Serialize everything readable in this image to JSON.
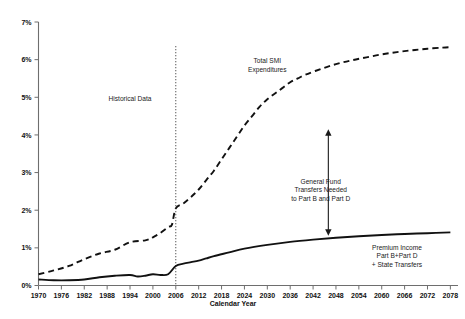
{
  "chart_data": {
    "type": "line",
    "title": "",
    "xlabel": "Calendar Year",
    "ylabel": "",
    "xlim": [
      1970,
      2080
    ],
    "ylim": [
      0,
      7
    ],
    "grid": false,
    "legend_position": "inline-annotations",
    "ytick_labels": [
      "0%",
      "1%",
      "2%",
      "3%",
      "4%",
      "5%",
      "6%",
      "7%"
    ],
    "ytick_values": [
      0,
      1,
      2,
      3,
      4,
      5,
      6,
      7
    ],
    "xtick_labels": [
      "1970",
      "1976",
      "1982",
      "1988",
      "1994",
      "2000",
      "2006",
      "2012",
      "2018",
      "2024",
      "2030",
      "2036",
      "2042",
      "2048",
      "2054",
      "2060",
      "2066",
      "2072",
      "2078"
    ],
    "xtick_values": [
      1970,
      1976,
      1982,
      1988,
      1994,
      2000,
      2006,
      2012,
      2018,
      2024,
      2030,
      2036,
      2042,
      2048,
      2054,
      2060,
      2066,
      2072,
      2078
    ],
    "series": [
      {
        "name": "Total SMI Expenditures",
        "style": "dashed",
        "x": [
          1970,
          1974,
          1978,
          1982,
          1986,
          1990,
          1994,
          1998,
          2000,
          2002,
          2004,
          2005,
          2006,
          2008,
          2010,
          2012,
          2014,
          2016,
          2018,
          2020,
          2022,
          2024,
          2026,
          2028,
          2030,
          2032,
          2034,
          2036,
          2038,
          2040,
          2044,
          2048,
          2052,
          2056,
          2060,
          2064,
          2068,
          2072,
          2076,
          2078
        ],
        "values": [
          0.3,
          0.4,
          0.52,
          0.7,
          0.85,
          0.95,
          1.15,
          1.2,
          1.28,
          1.4,
          1.55,
          1.62,
          2.05,
          2.18,
          2.35,
          2.55,
          2.8,
          3.05,
          3.35,
          3.65,
          3.95,
          4.25,
          4.5,
          4.75,
          4.95,
          5.1,
          5.25,
          5.4,
          5.5,
          5.6,
          5.75,
          5.88,
          5.98,
          6.06,
          6.14,
          6.2,
          6.25,
          6.29,
          6.32,
          6.33
        ]
      },
      {
        "name": "Premium Income Part B+Part D + State Transfers",
        "style": "solid",
        "x": [
          1970,
          1974,
          1978,
          1982,
          1986,
          1990,
          1994,
          1996,
          1998,
          2000,
          2002,
          2004,
          2006,
          2008,
          2010,
          2012,
          2014,
          2016,
          2020,
          2024,
          2030,
          2036,
          2042,
          2048,
          2054,
          2060,
          2066,
          2072,
          2078
        ],
        "values": [
          0.16,
          0.14,
          0.14,
          0.16,
          0.22,
          0.26,
          0.28,
          0.24,
          0.26,
          0.3,
          0.28,
          0.3,
          0.52,
          0.58,
          0.62,
          0.66,
          0.72,
          0.78,
          0.88,
          0.98,
          1.08,
          1.16,
          1.22,
          1.27,
          1.31,
          1.34,
          1.37,
          1.39,
          1.41
        ]
      }
    ],
    "annotations": [
      {
        "name": "historical-data",
        "text": "Historical Data",
        "x": 1994,
        "y": 4.9
      },
      {
        "name": "total-smi-expenditures",
        "text_lines": [
          "Total SMI",
          "Expenditures"
        ],
        "x": 2030,
        "y": 5.9
      },
      {
        "name": "general-fund-transfers",
        "text_lines": [
          "General Fund",
          "Transfers Needed",
          "to Part B and Part D"
        ],
        "x": 2044,
        "y": 2.7
      },
      {
        "name": "premium-income",
        "text_lines": [
          "Premium Income",
          "Part B+Part D",
          "+ State Transfers"
        ],
        "x": 2064,
        "y": 0.95
      }
    ],
    "divider": {
      "name": "projection-divider",
      "x": 2006,
      "style": "dotted"
    },
    "double_arrow": {
      "name": "gap-arrow",
      "x": 2046,
      "y_top": 4.15,
      "y_bottom": 1.32
    }
  },
  "colors": {
    "line": "#111111",
    "axis": "#6e6e6e",
    "background": "#ffffff",
    "divider": "#555555"
  }
}
